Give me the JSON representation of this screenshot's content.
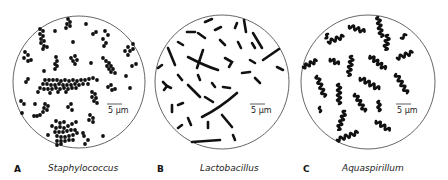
{
  "figure": {
    "panels": [
      {
        "letter": "A",
        "organism": "Staphylococcus",
        "morphology": "cocci in clusters",
        "scale_bar": "5 μm"
      },
      {
        "letter": "B",
        "organism": "Lactobacillus",
        "morphology": "rods (bacilli)",
        "scale_bar": "5 μm"
      },
      {
        "letter": "C",
        "organism": "Aquaspirillum",
        "morphology": "spirilla",
        "scale_bar": "5 μm"
      }
    ],
    "colors": {
      "cell": "#111111",
      "circle_outline": "#555555",
      "background": "#ffffff"
    }
  }
}
